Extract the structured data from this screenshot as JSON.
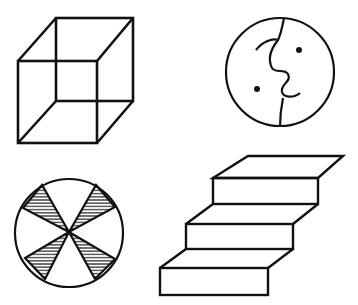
{
  "figure": {
    "background": "#ffffff",
    "stroke": "#111111",
    "figures": [
      {
        "name": "necker-cube"
      },
      {
        "name": "face-profile-circle"
      },
      {
        "name": "hatched-wheel"
      },
      {
        "name": "schroder-staircase"
      }
    ]
  }
}
